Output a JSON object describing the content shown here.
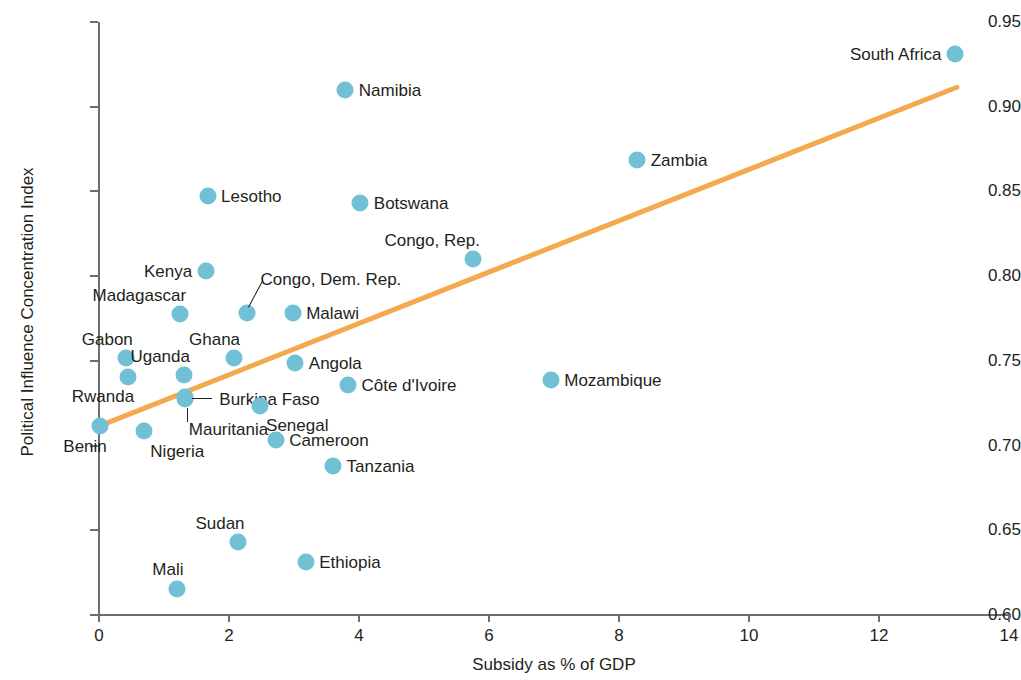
{
  "chart_data": {
    "type": "scatter",
    "title": "",
    "xlabel": "Subsidy as % of GDP",
    "ylabel": "Political Influence Concentration Index",
    "xlim": [
      0,
      14
    ],
    "ylim": [
      0.6,
      0.95
    ],
    "xticks": [
      "0",
      "2",
      "4",
      "6",
      "8",
      "10",
      "12",
      "14"
    ],
    "xtick_values": [
      0,
      2,
      4,
      6,
      8,
      10,
      12,
      14
    ],
    "yticks": [
      "0.60",
      "0.65",
      "0.70",
      "0.75",
      "0.80",
      "0.85",
      "0.90",
      "0.95"
    ],
    "ytick_values": [
      0.6,
      0.65,
      0.7,
      0.75,
      0.8,
      0.85,
      0.9,
      0.95
    ],
    "grid": false,
    "legend": "none",
    "marker_color": "#72c0d5",
    "trendline_color": "#f5a94e",
    "axis_color": "#6d6e71",
    "text_color": "#231f20",
    "trendline": {
      "x0": 0.0,
      "y0": 0.7115,
      "x1": 13.2,
      "y1": 0.9115
    },
    "points": [
      {
        "name": "Benin",
        "x": 0.02,
        "y": 0.7115,
        "label_pos": "below-left"
      },
      {
        "name": "Gabon",
        "x": 0.42,
        "y": 0.7515,
        "label_pos": "above-left"
      },
      {
        "name": "Rwanda",
        "x": 0.44,
        "y": 0.7405,
        "label_pos": "below-left"
      },
      {
        "name": "Nigeria",
        "x": 0.69,
        "y": 0.7085,
        "label_pos": "below-right"
      },
      {
        "name": "Mali",
        "x": 1.2,
        "y": 0.6155,
        "label_pos": "above-left"
      },
      {
        "name": "Madagascar",
        "x": 1.24,
        "y": 0.7775,
        "label_pos": "above-left"
      },
      {
        "name": "Uganda",
        "x": 1.3,
        "y": 0.7415,
        "label_pos": "above-left"
      },
      {
        "name": "Mauritania",
        "x": 1.32,
        "y": 0.7275,
        "label_pos": "below"
      },
      {
        "name": "Burkina Faso",
        "x": 1.32,
        "y": 0.7285,
        "label_pos": "leader-right"
      },
      {
        "name": "Lesotho",
        "x": 1.67,
        "y": 0.8475,
        "label_pos": "right"
      },
      {
        "name": "Kenya",
        "x": 1.64,
        "y": 0.803,
        "label_pos": "left"
      },
      {
        "name": "Ghana",
        "x": 2.07,
        "y": 0.7515,
        "label_pos": "above-left"
      },
      {
        "name": "Sudan",
        "x": 2.14,
        "y": 0.643,
        "label_pos": "above-left"
      },
      {
        "name": "Congo, Dem. Rep.",
        "x": 2.27,
        "y": 0.778,
        "label_pos": "leader-up"
      },
      {
        "name": "Senegal",
        "x": 2.47,
        "y": 0.7235,
        "label_pos": "below-right"
      },
      {
        "name": "Cameroon",
        "x": 2.72,
        "y": 0.7035,
        "label_pos": "right"
      },
      {
        "name": "Angola",
        "x": 3.02,
        "y": 0.7485,
        "label_pos": "right"
      },
      {
        "name": "Malawi",
        "x": 2.98,
        "y": 0.778,
        "label_pos": "right"
      },
      {
        "name": "Ethiopia",
        "x": 3.18,
        "y": 0.6315,
        "label_pos": "right"
      },
      {
        "name": "Tanzania",
        "x": 3.6,
        "y": 0.688,
        "label_pos": "right"
      },
      {
        "name": "Namibia",
        "x": 3.79,
        "y": 0.91,
        "label_pos": "right"
      },
      {
        "name": "Côte d'Ivoire",
        "x": 3.83,
        "y": 0.7355,
        "label_pos": "right"
      },
      {
        "name": "Botswana",
        "x": 4.02,
        "y": 0.843,
        "label_pos": "right"
      },
      {
        "name": "Congo, Rep.",
        "x": 5.76,
        "y": 0.81,
        "label_pos": "above-left"
      },
      {
        "name": "Mozambique",
        "x": 6.95,
        "y": 0.7385,
        "label_pos": "right"
      },
      {
        "name": "Zambia",
        "x": 8.28,
        "y": 0.8685,
        "label_pos": "right"
      },
      {
        "name": "South Africa",
        "x": 13.17,
        "y": 0.931,
        "label_pos": "left"
      }
    ]
  }
}
